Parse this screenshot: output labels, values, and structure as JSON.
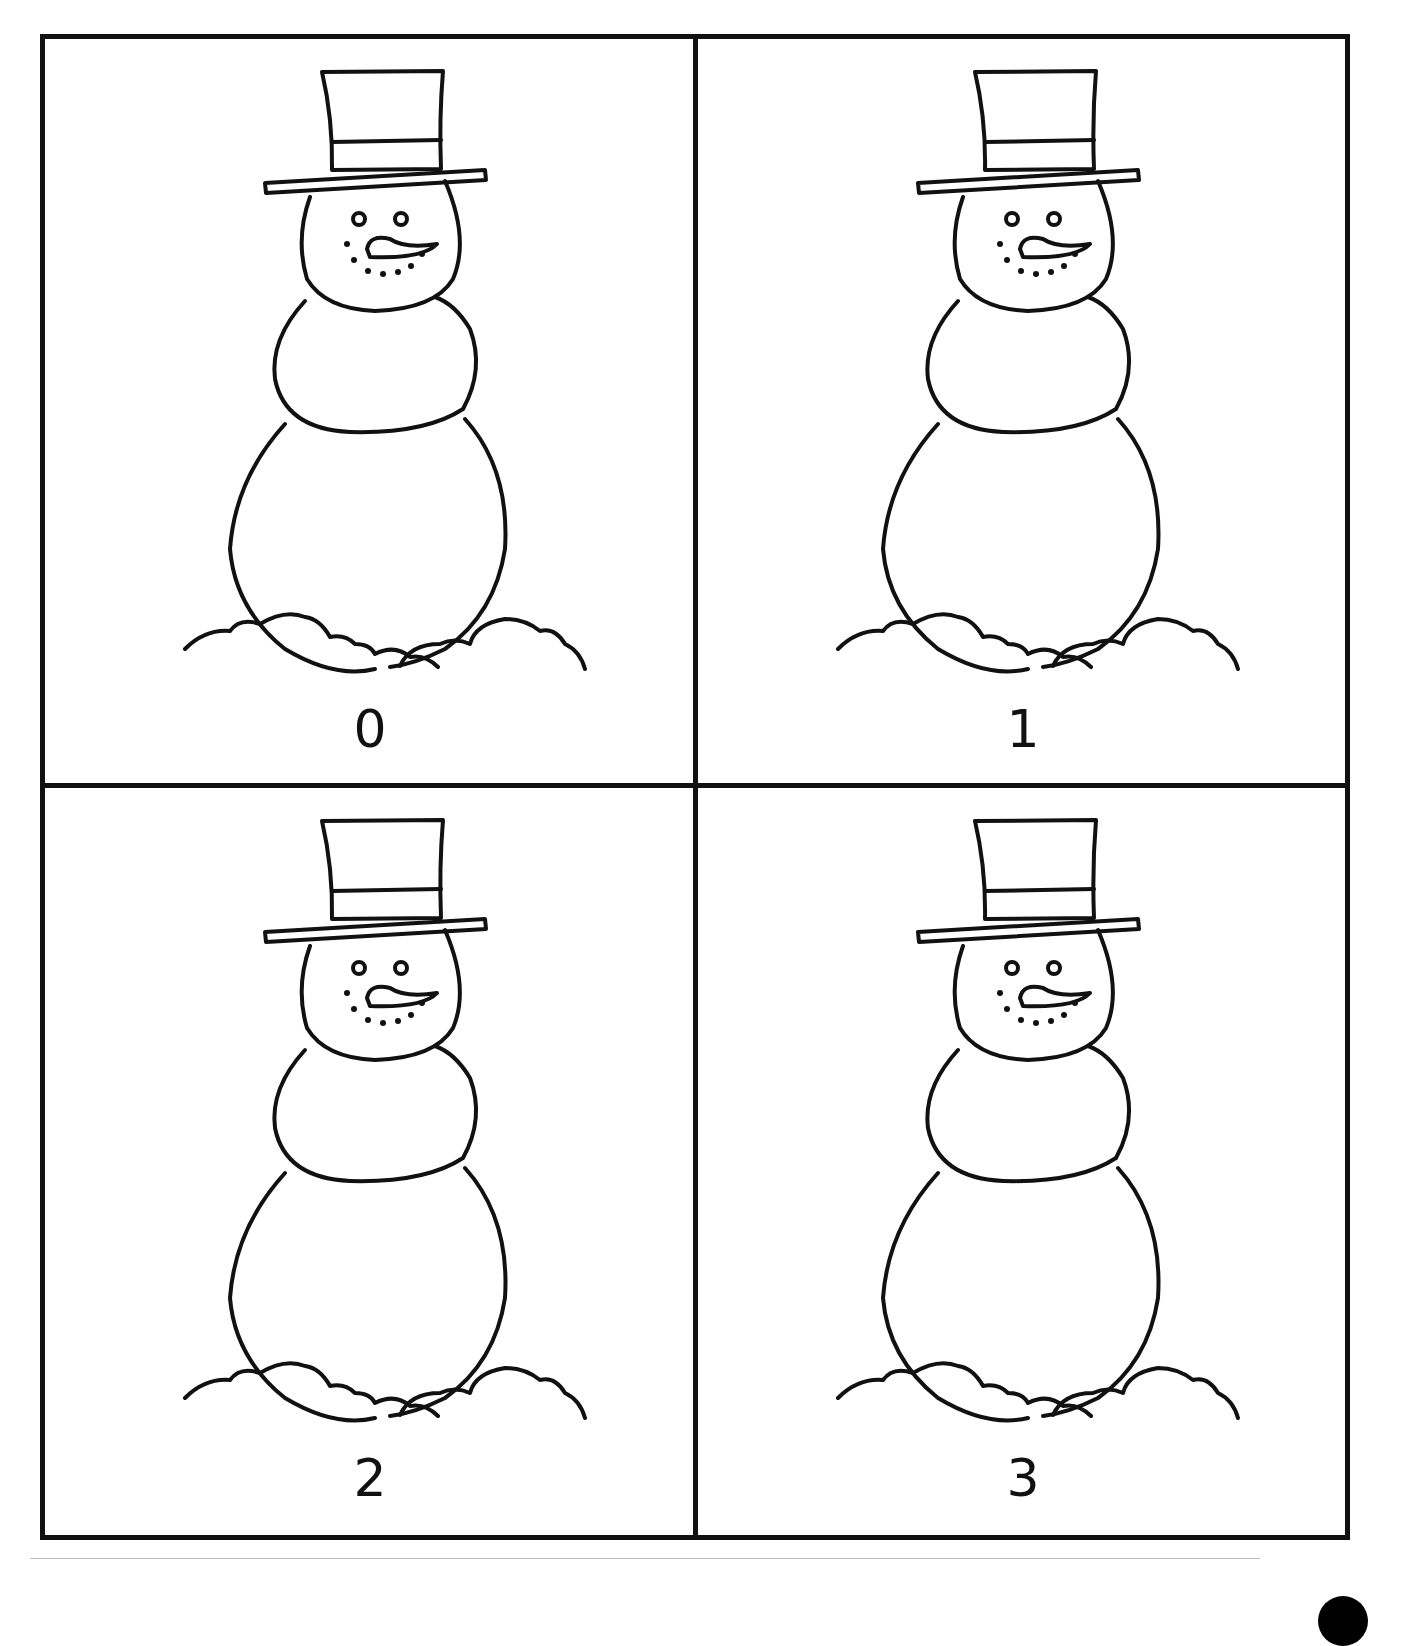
{
  "worksheet": {
    "type": "counting-cards",
    "cards": [
      {
        "label": "0",
        "image": "snowman-with-top-hat"
      },
      {
        "label": "1",
        "image": "snowman-with-top-hat"
      },
      {
        "label": "2",
        "image": "snowman-with-top-hat"
      },
      {
        "label": "3",
        "image": "snowman-with-top-hat"
      }
    ]
  },
  "colors": {
    "ink": "#111111",
    "paper": "#ffffff"
  }
}
